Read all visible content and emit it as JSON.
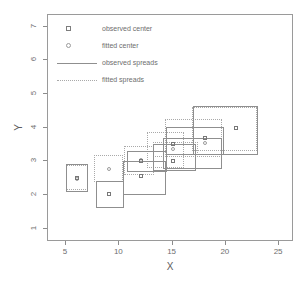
{
  "chart_data": {
    "type": "scatter",
    "title": "",
    "xlabel": "X",
    "ylabel": "Y",
    "xlim": [
      3.3,
      26.4
    ],
    "ylim": [
      0.6,
      7.35
    ],
    "xticks": [
      5,
      10,
      15,
      20,
      25
    ],
    "yticks": [
      1,
      2,
      3,
      4,
      5,
      6,
      7
    ],
    "grid": false,
    "legend": {
      "position": "top-left",
      "entries": [
        {
          "label": "observed center",
          "marker": "square-open",
          "style": "point"
        },
        {
          "label": "fitted center",
          "marker": "circle-open",
          "style": "point"
        },
        {
          "label": "observed spreads",
          "marker": "line-solid",
          "style": "line"
        },
        {
          "label": "fitted spreads",
          "marker": "line-dotted",
          "style": "line"
        }
      ]
    },
    "observed_centers": [
      {
        "x": 6.0,
        "y": 2.5
      },
      {
        "x": 9.0,
        "y": 2.02
      },
      {
        "x": 12.0,
        "y": 3.02
      },
      {
        "x": 12.0,
        "y": 2.55
      },
      {
        "x": 15.0,
        "y": 3.5
      },
      {
        "x": 15.0,
        "y": 3.02
      },
      {
        "x": 18.0,
        "y": 3.68
      },
      {
        "x": 21.0,
        "y": 4.0
      }
    ],
    "fitted_centers": [
      {
        "x": 6.0,
        "y": 2.46
      },
      {
        "x": 9.0,
        "y": 2.78
      },
      {
        "x": 12.0,
        "y": 3.05
      },
      {
        "x": 15.0,
        "y": 3.36
      },
      {
        "x": 18.0,
        "y": 3.55
      }
    ],
    "observed_spreads": [
      {
        "x0": 5.0,
        "x1": 7.1,
        "y0": 2.1,
        "y1": 2.92
      },
      {
        "x0": 7.8,
        "x1": 10.4,
        "y0": 1.62,
        "y1": 2.4
      },
      {
        "x0": 10.3,
        "x1": 14.4,
        "y0": 2.0,
        "y1": 3.02
      },
      {
        "x0": 10.7,
        "x1": 14.5,
        "y0": 2.68,
        "y1": 3.32
      },
      {
        "x0": 13.2,
        "x1": 17.2,
        "y0": 2.7,
        "y1": 3.52
      },
      {
        "x0": 14.4,
        "x1": 19.8,
        "y0": 3.18,
        "y1": 4.02
      },
      {
        "x0": 14.1,
        "x1": 19.6,
        "y0": 2.78,
        "y1": 3.68
      },
      {
        "x0": 16.9,
        "x1": 23.0,
        "y0": 3.2,
        "y1": 4.64
      }
    ],
    "fitted_spreads": [
      {
        "x0": 5.0,
        "x1": 7.1,
        "y0": 2.16,
        "y1": 2.88
      },
      {
        "x0": 7.6,
        "x1": 10.3,
        "y0": 2.38,
        "y1": 3.18
      },
      {
        "x0": 10.4,
        "x1": 13.3,
        "y0": 2.58,
        "y1": 3.46
      },
      {
        "x0": 12.6,
        "x1": 16.1,
        "y0": 2.8,
        "y1": 3.86
      },
      {
        "x0": 13.2,
        "x1": 17.4,
        "y0": 3.12,
        "y1": 3.56
      },
      {
        "x0": 14.3,
        "x1": 19.6,
        "y0": 3.12,
        "y1": 4.26
      },
      {
        "x0": 16.8,
        "x1": 22.9,
        "y0": 3.3,
        "y1": 4.62
      }
    ],
    "colors": {
      "frame": "#9a9a9a",
      "observed": "#8f8f8f",
      "fitted": "#a9a9a9",
      "text": "#6e6e6e"
    }
  }
}
